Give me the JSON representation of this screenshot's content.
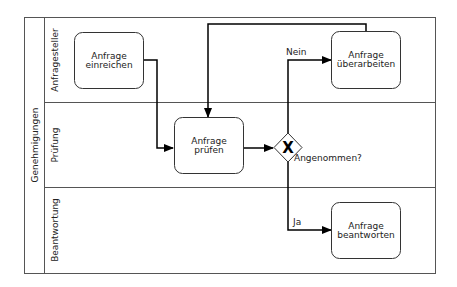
{
  "pool": {
    "label": "Genehmigungen"
  },
  "lanes": [
    {
      "label": "Anfragesteller"
    },
    {
      "label": "Prüfung"
    },
    {
      "label": "Beantwortung"
    }
  ],
  "tasks": [
    {
      "id": "t1",
      "line1": "Anfrage",
      "line2": "einreichen"
    },
    {
      "id": "t2",
      "line1": "Anfrage",
      "line2": "überarbeiten"
    },
    {
      "id": "t3",
      "line1": "Anfrage",
      "line2": "prüfen"
    },
    {
      "id": "t4",
      "line1": "Anfrage",
      "line2": "beantworten"
    }
  ],
  "gateway": {
    "type": "exclusive",
    "symbol": "X",
    "label": "Angenommen?"
  },
  "flows": {
    "no_label": "Nein",
    "yes_label": "Ja"
  },
  "colors": {
    "stroke": "#333333",
    "line": "#000000",
    "background": "#ffffff"
  }
}
